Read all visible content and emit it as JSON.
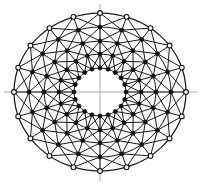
{
  "figure": {
    "background_color": "#ffffff",
    "mesh_color": "#1a1a1a",
    "axis_color": "#a8a8a8",
    "node_fill_solid": "#111111",
    "node_fill_hollow": "#ffffff",
    "node_stroke": "#111111"
  },
  "canvas": {
    "width": 201,
    "height": 185,
    "center_x": 100,
    "center_y": 92
  },
  "axes": {
    "horizontal": {
      "label": "horizontal-axis",
      "x1": 4,
      "y1": 92,
      "x2": 197,
      "y2": 92,
      "width": 1
    },
    "vertical": {
      "label": "vertical-axis",
      "x1": 100,
      "y1": 4,
      "x2": 100,
      "y2": 181,
      "width": 1
    }
  },
  "chart_data": {
    "type": "scatter",
    "xlabel": "",
    "ylabel": "",
    "layout": {
      "coordinate_system": "polar",
      "center": [
        100,
        92
      ],
      "grid": true,
      "legend": "none",
      "sectors": 20,
      "rings": 5,
      "hole": true
    },
    "rings": [
      {
        "index": 0,
        "name": "inner-hole-ring",
        "radius_x": 26,
        "radius_y": 24,
        "node_style": "solid",
        "drawn": true
      },
      {
        "index": 1,
        "name": "ring-1",
        "radius_x": 41,
        "radius_y": 38,
        "node_style": "solid",
        "drawn": true
      },
      {
        "index": 2,
        "name": "ring-2",
        "radius_x": 56,
        "radius_y": 51,
        "node_style": "solid",
        "drawn": true
      },
      {
        "index": 3,
        "name": "ring-3",
        "radius_x": 71,
        "radius_y": 65,
        "node_style": "solid",
        "drawn": true
      },
      {
        "index": 4,
        "name": "ring-4-outer",
        "radius_x": 86,
        "radius_y": 79,
        "node_style": "hollow",
        "drawn": true
      }
    ],
    "sector_angles_deg": [
      0,
      18,
      36,
      54,
      72,
      90,
      108,
      126,
      144,
      162,
      180,
      198,
      216,
      234,
      252,
      270,
      288,
      306,
      324,
      342
    ],
    "members": {
      "radial_spokes": 20,
      "circumferential_arcs": 5,
      "diagonal_braces_per_band": 40,
      "bands": 4
    },
    "node_counts": {
      "ring_0": 20,
      "ring_1": 20,
      "ring_2": 20,
      "ring_3": 20,
      "ring_4": 20,
      "total": 100
    }
  }
}
